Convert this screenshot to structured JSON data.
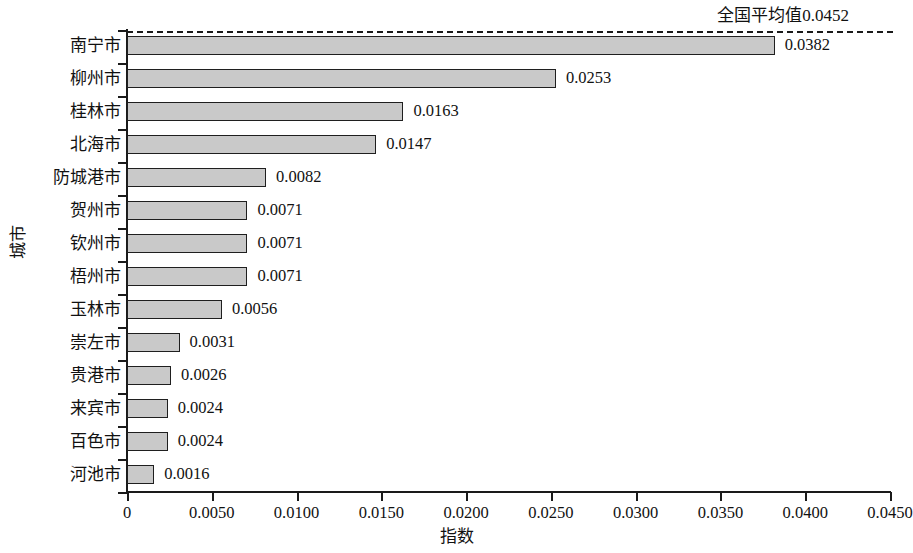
{
  "chart_data": {
    "type": "bar",
    "orientation": "horizontal",
    "title": "",
    "xlabel": "指数",
    "ylabel": "城市",
    "categories": [
      "南宁市",
      "柳州市",
      "桂林市",
      "北海市",
      "防城港市",
      "贺州市",
      "钦州市",
      "梧州市",
      "玉林市",
      "崇左市",
      "贵港市",
      "来宾市",
      "百色市",
      "河池市"
    ],
    "values": [
      0.0382,
      0.0253,
      0.0163,
      0.0147,
      0.0082,
      0.0071,
      0.0071,
      0.0071,
      0.0056,
      0.0031,
      0.0026,
      0.0024,
      0.0024,
      0.0016
    ],
    "value_labels": [
      "0.0382",
      "0.0253",
      "0.0163",
      "0.0147",
      "0.0082",
      "0.0071",
      "0.0071",
      "0.0071",
      "0.0056",
      "0.0031",
      "0.0026",
      "0.0024",
      "0.0024",
      "0.0016"
    ],
    "xlim": [
      0,
      0.045
    ],
    "xticks": [
      0,
      0.005,
      0.01,
      0.015,
      0.02,
      0.025,
      0.03,
      0.035,
      0.04,
      0.045
    ],
    "xtick_labels": [
      "0",
      "0.0050",
      "0.0100",
      "0.0150",
      "0.0200",
      "0.0250",
      "0.0300",
      "0.0350",
      "0.0400",
      "0.0450"
    ],
    "grid": false,
    "legend": null,
    "reference_line": {
      "label": "全国平均值0.0452",
      "value": 0.0452,
      "style": "dashed",
      "position": "top"
    },
    "bar_color": "#c9c9c9",
    "bar_edge_color": "#1f1f1f"
  },
  "annotation": {
    "average_label": "全国平均值0.0452"
  },
  "axes": {
    "x_title": "指数",
    "y_title": "城市"
  }
}
